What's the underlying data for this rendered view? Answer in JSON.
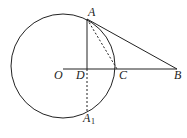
{
  "diagram": {
    "type": "geometry",
    "stroke_color": "#222222",
    "circle": {
      "center": "O",
      "cx": 63,
      "cy": 66,
      "r": 52
    },
    "points": {
      "O": {
        "x": 63,
        "y": 69,
        "label": "O"
      },
      "A": {
        "x": 87,
        "y": 19,
        "label": "A"
      },
      "D": {
        "x": 87,
        "y": 69,
        "label": "D"
      },
      "C": {
        "x": 117,
        "y": 69,
        "label": "C"
      },
      "B": {
        "x": 177,
        "y": 69,
        "label": "B"
      },
      "A1": {
        "x": 87,
        "y": 111,
        "label": "A",
        "subscript": "1"
      }
    },
    "segments": [
      {
        "from": "O",
        "to": "B",
        "style": "solid"
      },
      {
        "from": "A",
        "to": "D",
        "style": "solid"
      },
      {
        "from": "A",
        "to": "B",
        "style": "solid"
      },
      {
        "from": "A",
        "to": "C",
        "style": "dashed"
      },
      {
        "from": "D",
        "to": "A1",
        "style": "dashed"
      }
    ]
  }
}
